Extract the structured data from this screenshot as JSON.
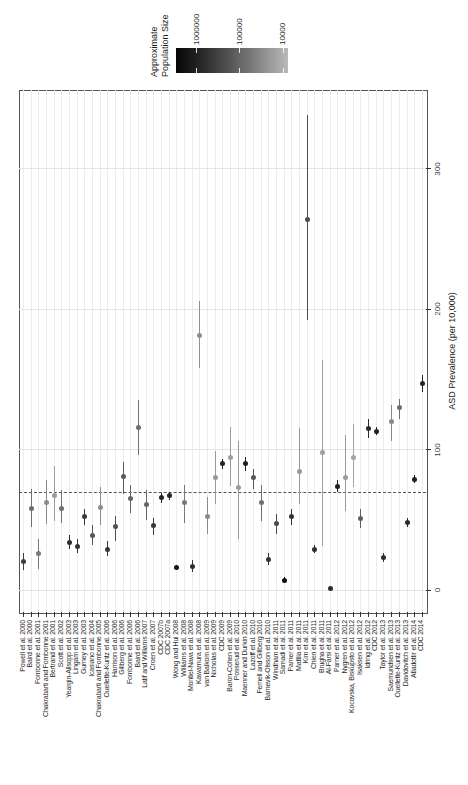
{
  "chart_data": {
    "type": "scatter",
    "orientation": "rotated_90ccw_portrait",
    "title": "",
    "value_axis": {
      "label": "ASD Prevalence (per 10,000)",
      "ticks": [
        0,
        100,
        200,
        300
      ],
      "range": [
        -16,
        356
      ],
      "grid": true
    },
    "reference_line": {
      "value": 70,
      "style": "dashed"
    },
    "legend": {
      "title_line1": "Approximate",
      "title_line2": "Population Size",
      "scale": "log",
      "tick_labels": [
        "1000000",
        "100000",
        "10000"
      ],
      "gradient_dark_end": "#060606",
      "gradient_light_end": "#b9b9b9"
    },
    "studies": [
      {
        "label": "Powell et al. 2000",
        "prevalence": 20,
        "ci": [
          14,
          26
        ],
        "color": "#3f3f3f"
      },
      {
        "label": "Baird et al. 2000",
        "prevalence": 58,
        "ci": [
          45,
          72
        ],
        "color": "#6e6e6e"
      },
      {
        "label": "Fombonne et al. 2001",
        "prevalence": 26,
        "ci": [
          15,
          36
        ],
        "color": "#787878"
      },
      {
        "label": "Chakrabarti and Fombonne 2001",
        "prevalence": 62,
        "ci": [
          47,
          78
        ],
        "color": "#8c8c8c"
      },
      {
        "label": "Bertrand et al. 2001",
        "prevalence": 67,
        "ci": [
          49,
          88
        ],
        "color": "#9c9c9c"
      },
      {
        "label": "Scott et al. 2002",
        "prevalence": 58,
        "ci": [
          48,
          71
        ],
        "color": "#707070"
      },
      {
        "label": "Yeargin-Allsopp et al. 2003",
        "prevalence": 34,
        "ci": [
          29,
          39
        ],
        "color": "#2e2e2e"
      },
      {
        "label": "Lingam et al. 2003",
        "prevalence": 31,
        "ci": [
          26,
          36
        ],
        "color": "#333333"
      },
      {
        "label": "Gurney et al. 2003",
        "prevalence": 52,
        "ci": [
          46,
          58
        ],
        "color": "#3a3a3a"
      },
      {
        "label": "Icasiano et al. 2004",
        "prevalence": 39,
        "ci": [
          32,
          46
        ],
        "color": "#575757"
      },
      {
        "label": "Chakrabarti and Fombonne 2005",
        "prevalence": 59,
        "ci": [
          46,
          73
        ],
        "color": "#8c8c8c"
      },
      {
        "label": "Ouellette-Kuntz et al. 2006",
        "prevalence": 29,
        "ci": [
          24,
          35
        ],
        "color": "#383838"
      },
      {
        "label": "Harrison et al. 2006",
        "prevalence": 45,
        "ci": [
          35,
          53
        ],
        "color": "#505050"
      },
      {
        "label": "Gillberg et al. 2006",
        "prevalence": 81,
        "ci": [
          68,
          91
        ],
        "color": "#5a5a5a"
      },
      {
        "label": "Fombonne et al. 2006",
        "prevalence": 65,
        "ci": [
          55,
          75
        ],
        "color": "#666666"
      },
      {
        "label": "Baird et al. 2006",
        "prevalence": 116,
        "ci": [
          96,
          135
        ],
        "color": "#707070"
      },
      {
        "label": "Latif and Williams 2007",
        "prevalence": 61,
        "ci": [
          50,
          71
        ],
        "color": "#666666"
      },
      {
        "label": "Croen et al. 2007",
        "prevalence": 46,
        "ci": [
          39,
          51
        ],
        "color": "#3a3a3a"
      },
      {
        "label": "CDC 2007b",
        "prevalence": 66,
        "ci": [
          62,
          69
        ],
        "color": "#242424"
      },
      {
        "label": "CDC 2007a",
        "prevalence": 67,
        "ci": [
          64,
          70
        ],
        "color": "#242424"
      },
      {
        "label": "Wong and Hui 2008",
        "prevalence": 16,
        "ci": [
          14,
          18
        ],
        "color": "#141414"
      },
      {
        "label": "Williams et al. 2008",
        "prevalence": 62,
        "ci": [
          48,
          75
        ],
        "color": "#7a7a7a"
      },
      {
        "label": "Montiel-Nava et al. 2008",
        "prevalence": 17,
        "ci": [
          13,
          21
        ],
        "color": "#2e2e2e"
      },
      {
        "label": "Kawamura et al. 2008",
        "prevalence": 181,
        "ci": [
          158,
          206
        ],
        "color": "#8f8f8f"
      },
      {
        "label": "van Balkom et al. 2009",
        "prevalence": 52,
        "ci": [
          40,
          66
        ],
        "color": "#8a8a8a"
      },
      {
        "label": "Nicholas et al. 2009",
        "prevalence": 80,
        "ci": [
          61,
          99
        ],
        "color": "#999999"
      },
      {
        "label": "CDC 2009",
        "prevalence": 90,
        "ci": [
          86,
          93
        ],
        "color": "#242424"
      },
      {
        "label": "Baron-Cohen et al. 2009",
        "prevalence": 94,
        "ci": [
          74,
          116
        ],
        "color": "#9e9e9e"
      },
      {
        "label": "Posserud et al. 2010",
        "prevalence": 73,
        "ci": [
          36,
          106
        ],
        "color": "#9a9a9a"
      },
      {
        "label": "Maenner and Durkin 2010",
        "prevalence": 90,
        "ci": [
          85,
          95
        ],
        "color": "#1f1f1f"
      },
      {
        "label": "Lazoff et al. 2010",
        "prevalence": 80,
        "ci": [
          72,
          86
        ],
        "color": "#575757"
      },
      {
        "label": "Fernell and Gillberg 2010",
        "prevalence": 62,
        "ci": [
          49,
          75
        ],
        "color": "#707070"
      },
      {
        "label": "Barnevik-Olsson et al. 2010",
        "prevalence": 22,
        "ci": [
          18,
          26
        ],
        "color": "#333333"
      },
      {
        "label": "Windham et al. 2011",
        "prevalence": 47,
        "ci": [
          40,
          54
        ],
        "color": "#4a4a4a"
      },
      {
        "label": "Samadi et al. 2011",
        "prevalence": 7,
        "ci": [
          5,
          9
        ],
        "color": "#0f0f0f"
      },
      {
        "label": "Parner et al. 2011",
        "prevalence": 52,
        "ci": [
          46,
          58
        ],
        "color": "#333333"
      },
      {
        "label": "Mattila et al. 2011",
        "prevalence": 84,
        "ci": [
          61,
          115
        ],
        "color": "#999999"
      },
      {
        "label": "Kim et al. 2011",
        "prevalence": 264,
        "ci": [
          192,
          338
        ],
        "color": "#4d4d4d"
      },
      {
        "label": "Chien et al. 2011",
        "prevalence": 29,
        "ci": [
          26,
          32
        ],
        "color": "#2e2e2e"
      },
      {
        "label": "Brugha et al. 2011",
        "prevalence": 98,
        "ci": [
          31,
          164
        ],
        "color": "#9e9e9e"
      },
      {
        "label": "Al-Farsi et al. 2011",
        "prevalence": 1.4,
        "ci": [
          1,
          2
        ],
        "color": "#2a2a2a"
      },
      {
        "label": "Parner et al. 2012",
        "prevalence": 74,
        "ci": [
          70,
          78
        ],
        "color": "#1f1f1f"
      },
      {
        "label": "Nygren et al. 2012",
        "prevalence": 80,
        "ci": [
          56,
          110
        ],
        "color": "#9a9a9a"
      },
      {
        "label": "Kocovska, Biskupsto et al. 2012",
        "prevalence": 94,
        "ci": [
          73,
          118
        ],
        "color": "#a5a5a5"
      },
      {
        "label": "Isaksen et al. 2012",
        "prevalence": 51,
        "ci": [
          44,
          58
        ],
        "color": "#5e5e5e"
      },
      {
        "label": "Idring et al. 2012",
        "prevalence": 115,
        "ci": [
          108,
          122
        ],
        "color": "#2a2a2a"
      },
      {
        "label": "CDC 2012",
        "prevalence": 113,
        "ci": [
          110,
          116
        ],
        "color": "#242424"
      },
      {
        "label": "Taylor et al. 2013",
        "prevalence": 23,
        "ci": [
          20,
          26
        ],
        "color": "#2e2e2e"
      },
      {
        "label": "Saemundsen et al. 2013",
        "prevalence": 120,
        "ci": [
          106,
          132
        ],
        "color": "#8a8a8a"
      },
      {
        "label": "Ouellette-Kuntz et al. 2013",
        "prevalence": 130,
        "ci": [
          122,
          136
        ],
        "color": "#6e6e6e"
      },
      {
        "label": "Davidovitch et al. 2013",
        "prevalence": 48,
        "ci": [
          45,
          51
        ],
        "color": "#2a2a2a"
      },
      {
        "label": "Atladottir et al. 2014",
        "prevalence": 79,
        "ci": [
          76,
          82
        ],
        "color": "#1f1f1f"
      },
      {
        "label": "CDC 2014",
        "prevalence": 147,
        "ci": [
          141,
          153
        ],
        "color": "#242424"
      }
    ]
  }
}
